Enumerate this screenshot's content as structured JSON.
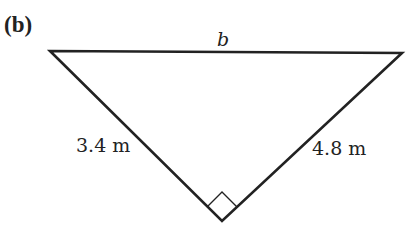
{
  "figure": {
    "part_label": "(b)",
    "shape": "right triangle",
    "top_side_label": "b",
    "left_side_label": "3.4 m",
    "right_side_label": "4.8 m",
    "right_angle_marker": "bottom vertex",
    "colors": {
      "line": "#222222",
      "background": "#ffffff"
    }
  }
}
